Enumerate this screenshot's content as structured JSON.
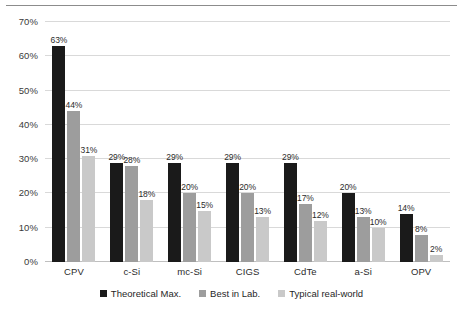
{
  "chart_data": {
    "type": "bar",
    "title": "",
    "subtitle": "",
    "xlabel": "",
    "ylabel": "",
    "ylim": [
      0,
      70
    ],
    "ytick_values": [
      0,
      10,
      20,
      30,
      40,
      50,
      60,
      70
    ],
    "ytick_labels": [
      "0%",
      "10%",
      "20%",
      "30%",
      "40%",
      "50%",
      "60%",
      "70%"
    ],
    "grid": true,
    "legend_position": "bottom",
    "value_suffix": "%",
    "categories": [
      "CPV",
      "c-Si",
      "mc-Si",
      "CIGS",
      "CdTe",
      "a-Si",
      "OPV"
    ],
    "series": [
      {
        "name": "Theoretical Max.",
        "color": "#1a1a1a",
        "values": [
          63,
          29,
          29,
          29,
          29,
          20,
          14
        ],
        "labels": [
          "63%",
          "29%",
          "29%",
          "29%",
          "29%",
          "20%",
          "14%"
        ]
      },
      {
        "name": "Best in Lab.",
        "color": "#9d9d9d",
        "values": [
          44,
          28,
          20,
          20,
          17,
          13,
          8
        ],
        "labels": [
          "44%",
          "28%",
          "20%",
          "20%",
          "17%",
          "13%",
          "8%"
        ]
      },
      {
        "name": "Typical real-world",
        "color": "#c9c9c9",
        "values": [
          31,
          18,
          15,
          13,
          12,
          10,
          2
        ],
        "labels": [
          "31%",
          "18%",
          "15%",
          "13%",
          "12%",
          "10%",
          "2%"
        ]
      }
    ]
  },
  "colors": {
    "series_theoretical": "#1a1a1a",
    "series_lab": "#9d9d9d",
    "series_real_world": "#c9c9c9",
    "gridline": "#d9d9d9",
    "background": "#ffffff",
    "text": "#2b2b2b"
  }
}
